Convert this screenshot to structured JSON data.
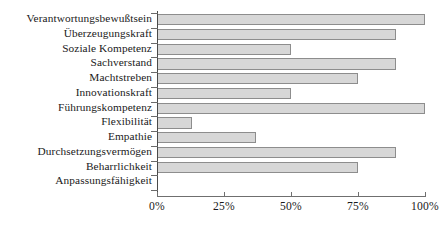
{
  "chart_data": {
    "type": "bar",
    "orientation": "horizontal",
    "title": "",
    "subtitle": "",
    "xlabel": "",
    "ylabel": "",
    "xlim": [
      0,
      100
    ],
    "grid": false,
    "legend": null,
    "tick_labels": [
      "0%",
      "25%",
      "50%",
      "75%",
      "100%"
    ],
    "tick_values": [
      0,
      25,
      50,
      75,
      100
    ],
    "categories": [
      "Verantwortungsbewußtsein",
      "Überzeugungskraft",
      "Soziale Kompetenz",
      "Sachverstand",
      "Machtstreben",
      "Innovationskraft",
      "Führungskompetenz",
      "Flexibilität",
      "Empathie",
      "Durchsetzungsvermögen",
      "Beharrlichkeit",
      "Anpassungsfähigkeit"
    ],
    "values": [
      100,
      89,
      50,
      89,
      75,
      50,
      100,
      13,
      37,
      89,
      75,
      0
    ],
    "bar_fill_color": "#d7d7d7",
    "bar_border_color": "#8d8d8d",
    "axis_color": "#6f6f6f",
    "background_color": "#ffffff"
  }
}
